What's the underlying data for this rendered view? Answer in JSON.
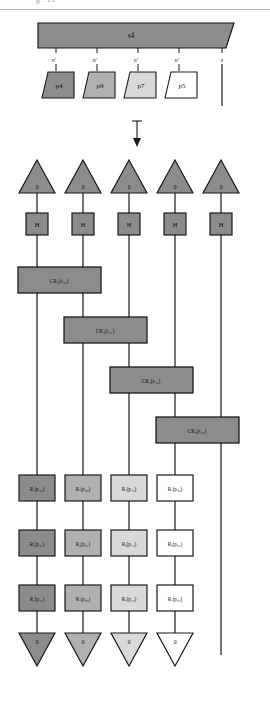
{
  "page": {
    "cut_header_text": "g. 11",
    "arrow_glyph": "↓",
    "background": "#ffffff"
  },
  "colors": {
    "dark_gray": "#8c8c8c",
    "mid_gray": "#b0b0b0",
    "light_gray": "#d9d9d9",
    "white": "#ffffff",
    "box_gray": "#8c8c8c",
    "stroke": "#1a1a1a"
  },
  "top_diagram": {
    "parent": {
      "label": "s4",
      "fill": "#8c8c8c",
      "shape": "parallelogram"
    },
    "edge_labels": [
      "n′",
      "n′",
      "n′",
      "n′",
      "s"
    ],
    "children": [
      {
        "label": "p4",
        "fill": "#8c8c8c"
      },
      {
        "label": "p9",
        "fill": "#b0b0b0"
      },
      {
        "label": "p7",
        "fill": "#d9d9d9"
      },
      {
        "label": "p5",
        "fill": "#ffffff"
      }
    ],
    "bare_wire": {
      "label": "s"
    }
  },
  "circuit": {
    "wire_count": 5,
    "input_triangles": [
      {
        "label": "0",
        "fill": "#8c8c8c"
      },
      {
        "label": "0",
        "fill": "#8c8c8c"
      },
      {
        "label": "0",
        "fill": "#8c8c8c"
      },
      {
        "label": "0",
        "fill": "#8c8c8c"
      },
      {
        "label": "0",
        "fill": "#8c8c8c"
      }
    ],
    "hadamards": [
      {
        "label": "H",
        "fill": "#8c8c8c"
      },
      {
        "label": "H",
        "fill": "#8c8c8c"
      },
      {
        "label": "H",
        "fill": "#8c8c8c"
      },
      {
        "label": "H",
        "fill": "#8c8c8c"
      },
      {
        "label": "H",
        "fill": "#8c8c8c"
      }
    ],
    "controlled_rotations": [
      {
        "base": "CR",
        "index": "2",
        "arg_base": "s",
        "arg_sub": "4₀",
        "text": "CR₂(s₄₀)",
        "from_wire": 0,
        "to_wire": 1,
        "fill": "#8c8c8c"
      },
      {
        "base": "CR",
        "index": "3",
        "arg_base": "s",
        "arg_sub": "4₁",
        "text": "CR₃(s₄₁)",
        "from_wire": 1,
        "to_wire": 2,
        "fill": "#8c8c8c"
      },
      {
        "base": "CR",
        "index": "4",
        "arg_base": "s",
        "arg_sub": "4₂",
        "text": "CR₄(s₄₂)",
        "from_wire": 2,
        "to_wire": 3,
        "fill": "#8c8c8c"
      },
      {
        "base": "CR",
        "index": "5",
        "arg_base": "s",
        "arg_sub": "4₃",
        "text": "CR₅(s₄₃)",
        "from_wire": 3,
        "to_wire": 4,
        "fill": "#8c8c8c"
      }
    ],
    "rotation_rows": [
      {
        "row": 0,
        "gates": [
          {
            "text": "Rₓ(p₄₀)",
            "base": "R",
            "axis": "x",
            "arg": "p",
            "sub": "4₀",
            "fill": "#8c8c8c"
          },
          {
            "text": "Rₓ(p₉₀)",
            "base": "R",
            "axis": "x",
            "arg": "p",
            "sub": "9₀",
            "fill": "#b0b0b0"
          },
          {
            "text": "Rₓ(p₇₀)",
            "base": "R",
            "axis": "x",
            "arg": "p",
            "sub": "7₀",
            "fill": "#d9d9d9"
          },
          {
            "text": "Rₓ(p₅₀)",
            "base": "R",
            "axis": "x",
            "arg": "p",
            "sub": "5₀",
            "fill": "#ffffff"
          }
        ]
      },
      {
        "row": 1,
        "gates": [
          {
            "text": "Rᵧ(p₄₁)",
            "base": "R",
            "axis": "y",
            "arg": "p",
            "sub": "4₁",
            "fill": "#8c8c8c"
          },
          {
            "text": "Rᵧ(p₉₁)",
            "base": "R",
            "axis": "y",
            "arg": "p",
            "sub": "9₁",
            "fill": "#b0b0b0"
          },
          {
            "text": "Rᵧ(p₇₁)",
            "base": "R",
            "axis": "y",
            "arg": "p",
            "sub": "7₁",
            "fill": "#d9d9d9"
          },
          {
            "text": "Rᵧ(p₅₁)",
            "base": "R",
            "axis": "y",
            "arg": "p",
            "sub": "5₁",
            "fill": "#ffffff"
          }
        ]
      },
      {
        "row": 2,
        "gates": [
          {
            "text": "Rₓ(p₄₂)",
            "base": "R",
            "axis": "z",
            "arg": "p",
            "sub": "4₂",
            "fill": "#8c8c8c"
          },
          {
            "text": "Rₓ(p₉₂)",
            "base": "R",
            "axis": "z",
            "arg": "p",
            "sub": "9₂",
            "fill": "#b0b0b0"
          },
          {
            "text": "Rₓ(p₇₂)",
            "base": "R",
            "axis": "z",
            "arg": "p",
            "sub": "7₂",
            "fill": "#d9d9d9"
          },
          {
            "text": "Rₓ(p₅₂)",
            "base": "R",
            "axis": "z",
            "arg": "p",
            "sub": "5₂",
            "fill": "#ffffff"
          }
        ]
      }
    ],
    "output_triangles": [
      {
        "label": "0",
        "fill": "#8c8c8c"
      },
      {
        "label": "0",
        "fill": "#b0b0b0"
      },
      {
        "label": "0",
        "fill": "#d9d9d9"
      },
      {
        "label": "0",
        "fill": "#ffffff"
      }
    ]
  }
}
